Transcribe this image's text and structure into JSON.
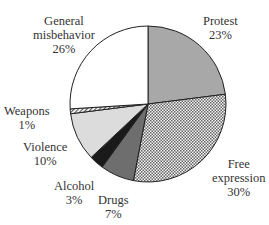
{
  "chart_data": {
    "type": "pie",
    "title": "",
    "categories": [
      "Protest",
      "Free expression",
      "Drugs",
      "Alcohol",
      "Violence",
      "Weapons",
      "General misbehavior"
    ],
    "values": [
      23,
      30,
      7,
      3,
      10,
      1,
      26
    ],
    "unit": "%",
    "start_angle": "12 o'clock",
    "direction": "clockwise",
    "fills": [
      "#a8a8a8",
      "crosshatch",
      "#6e6e6e",
      "#1a1a1a",
      "#dcdcdc",
      "diagonal-hatch",
      "#ffffff"
    ],
    "legend": "none (direct labels)"
  },
  "labels": [
    {
      "name": "Protest",
      "line1": "Protest",
      "line2": "23%"
    },
    {
      "name": "Free expression",
      "line1": "Free",
      "line2": "expression",
      "line3": "30%"
    },
    {
      "name": "Drugs",
      "line1": "Drugs",
      "line2": "7%"
    },
    {
      "name": "Alcohol",
      "line1": "Alcohol",
      "line2": "3%"
    },
    {
      "name": "Violence",
      "line1": "Violence",
      "line2": "10%"
    },
    {
      "name": "Weapons",
      "line1": "Weapons",
      "line2": "1%"
    },
    {
      "name": "General misbehavior",
      "line1": "General",
      "line2": "misbehavior",
      "line3": "26%"
    }
  ]
}
